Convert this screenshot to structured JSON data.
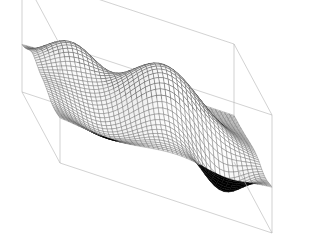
{
  "figure": {
    "title": "",
    "width": 325,
    "height": 245,
    "background": "#ffffff",
    "has_axis_labels": false,
    "has_tick_labels": false,
    "has_legend": false,
    "has_colorbar": false,
    "render_style": "shaded-mesh-surface"
  },
  "chart_data": {
    "type": "surface",
    "title": "",
    "xlabel": "",
    "ylabel": "",
    "zlabel": "",
    "colormap": "gray",
    "shading": "faceted",
    "mesh": {
      "nx": 45,
      "ny": 45,
      "line_color": "#555555",
      "line_width": 0.35,
      "underside_color": "#000000"
    },
    "lighting": {
      "azimuth_deg": -55,
      "elevation_deg": 60,
      "ambient": 0.34,
      "diffuse": 0.66
    },
    "view": {
      "azimuth_deg": -37.5,
      "elevation_deg": 26,
      "projection": "orthographic"
    },
    "xlim": [
      -3,
      3
    ],
    "ylim": [
      -3,
      3
    ],
    "zlim": [
      -0.75,
      1.15
    ],
    "surface_function": "peaks-like: z = 0.95*exp(-((x-0.45)^2+(y+0.25)^2)/2.2) + 0.55*exp(-((x+1.9)^2+(y-1.35)^2)/1.1) - 0.62*exp(-((x-1.7)^2+(y+1.85)^2)/0.8) - 0.30*exp(-((x+1.5)^2+(y+1.7)^2)/1.6)",
    "features": [
      {
        "name": "central-dome",
        "x": 0.45,
        "y": -0.25,
        "z": 0.95
      },
      {
        "name": "back-ridge-bump",
        "x": -1.9,
        "y": 1.35,
        "z": 0.55
      },
      {
        "name": "back-saddle-dip",
        "x": -0.3,
        "y": 1.95,
        "z": 0.18
      },
      {
        "name": "front-right-trough",
        "x": 1.7,
        "y": -1.85,
        "z": -0.62
      },
      {
        "name": "left-tail",
        "x": -2.6,
        "y": -0.6,
        "z": 0.05
      }
    ],
    "box": {
      "visible": true,
      "line_color": "#b4b4b4",
      "line_width": 0.6,
      "corners_px": {
        "left": [
          22,
          92
        ],
        "back_top": [
          283,
          21
        ],
        "front_bottom": [
          60,
          163
        ],
        "right_bottom": [
          272,
          233
        ]
      }
    }
  }
}
